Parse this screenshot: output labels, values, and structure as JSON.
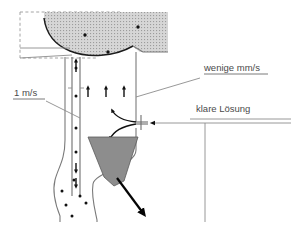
{
  "diagram": {
    "background_color": "#ffffff",
    "width": 291,
    "height": 228,
    "labels": [
      {
        "id": "velocity-slow",
        "text": "wenige mm/s",
        "x": 204,
        "y": 71,
        "underlined": true,
        "color": "#4a4a4a",
        "meaning": "upflow velocity in the clarification zone"
      },
      {
        "id": "velocity-fast",
        "text": "1 m/s",
        "x": 14,
        "y": 96,
        "underlined": true,
        "color": "#4a4a4a",
        "meaning": "velocity inside the draft tube / riser"
      },
      {
        "id": "clear-solution",
        "text": "klare Lösung",
        "x": 196,
        "y": 112,
        "underlined": false,
        "color": "#4a4a4a",
        "meaning": "clear solution feed entering through the inlet nozzle"
      }
    ],
    "colors": {
      "sludge_blanket": "#c9c9c9",
      "cone": "#8d8d8d",
      "outline": "#7a7a7a",
      "arrow": "#111111",
      "text": "#4a4a4a",
      "blanket_edge": "#1c1c1c"
    },
    "elements": {
      "sludge_blanket": {
        "name": "sludge blanket",
        "fill_style": "stippled gray",
        "particle_dots": [
          {
            "x": 85,
            "y": 35
          },
          {
            "x": 138,
            "y": 27
          },
          {
            "x": 108,
            "y": 52
          }
        ]
      },
      "draft_tube": {
        "name": "draft tube riser",
        "x_left": 72,
        "x_right": 80,
        "y_top": 57,
        "y_bottom": 196,
        "internal_dots": [
          {
            "x": 76,
            "y": 68
          },
          {
            "x": 76,
            "y": 96
          },
          {
            "x": 76,
            "y": 128
          },
          {
            "x": 76,
            "y": 152
          }
        ]
      },
      "inlet_nozzle": {
        "name": "clear solution inlet nozzle",
        "x": 140,
        "y": 122,
        "direction": "left"
      },
      "sludge_cone": {
        "name": "sludge collection cone",
        "fill": "#8d8d8d"
      },
      "bottom_hopper": {
        "name": "bottom hopper with settled particles",
        "particle_dots": [
          {
            "x": 74,
            "y": 180
          },
          {
            "x": 62,
            "y": 191
          },
          {
            "x": 80,
            "y": 196
          },
          {
            "x": 66,
            "y": 205
          },
          {
            "x": 86,
            "y": 203
          },
          {
            "x": 72,
            "y": 216
          }
        ]
      },
      "discharge_arrow": {
        "name": "sludge discharge arrow",
        "direction": "down-right"
      }
    },
    "flow_arrows": [
      {
        "id": "upflow-1",
        "x": 88,
        "y_from": 96,
        "y_to": 84,
        "direction": "up"
      },
      {
        "id": "upflow-2",
        "x": 106,
        "y_from": 96,
        "y_to": 84,
        "direction": "up"
      },
      {
        "id": "upflow-3",
        "x": 124,
        "y_from": 96,
        "y_to": 84,
        "direction": "up"
      },
      {
        "id": "riser-top",
        "x": 76,
        "y_from": 72,
        "y_to": 58,
        "direction": "up"
      },
      {
        "id": "downflow-1",
        "x": 76,
        "y_from": 160,
        "y_to": 172,
        "direction": "down"
      },
      {
        "id": "downflow-2",
        "x": 76,
        "y_from": 176,
        "y_to": 186,
        "direction": "down"
      },
      {
        "id": "recirc-up",
        "x": 110,
        "y_from": 120,
        "y_to": 106,
        "direction": "up"
      },
      {
        "id": "recirc-down",
        "x": 110,
        "y_from": 126,
        "y_to": 140,
        "direction": "down"
      }
    ]
  }
}
